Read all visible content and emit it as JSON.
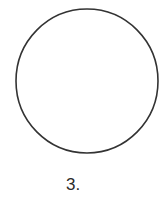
{
  "figure": {
    "shape": "circle",
    "label": "3.",
    "stroke_color": "#333333",
    "fill_color": "#ffffff"
  }
}
